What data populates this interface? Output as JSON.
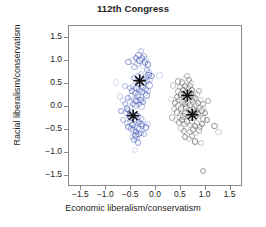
{
  "chart_data": {
    "type": "scatter",
    "title": "112th Congress",
    "xlabel": "Economic liberalism/conservatism",
    "ylabel": "Racial liberalism/conservatism",
    "xlim": [
      -1.75,
      1.75
    ],
    "ylim": [
      -1.75,
      1.75
    ],
    "xticks": [
      -1.5,
      -1.0,
      -0.5,
      0.0,
      0.5,
      1.0,
      1.5
    ],
    "xticklabels": [
      "−1.5",
      "−1.0",
      "−0.5",
      "0.0",
      "0.5",
      "1.0",
      "1.5"
    ],
    "yticks": [
      1.5,
      1.0,
      0.5,
      0.0,
      -0.5,
      -1.0,
      -1.5
    ],
    "yticklabels": [
      "1.5",
      "1.0",
      "0.5",
      "0.0",
      "−0.5",
      "−1.0",
      "−1.5"
    ],
    "grid": false,
    "legend": false,
    "frame": true,
    "series": [
      {
        "name": "democrats",
        "marker": "open-circle",
        "color": "#5b6fc0",
        "points": [
          [
            -0.8,
            0.52
          ],
          [
            -0.62,
            0.44
          ],
          [
            -0.55,
            0.97
          ],
          [
            -0.47,
            1.0
          ],
          [
            -0.43,
            0.86
          ],
          [
            -0.4,
            1.05
          ],
          [
            -0.37,
            0.93
          ],
          [
            -0.35,
            1.12
          ],
          [
            -0.33,
            1.0
          ],
          [
            -0.3,
            1.21
          ],
          [
            -0.28,
            1.04
          ],
          [
            -0.26,
            0.88
          ],
          [
            -0.24,
            1.1
          ],
          [
            -0.22,
            0.96
          ],
          [
            -0.2,
            1.02
          ],
          [
            -0.18,
            0.8
          ],
          [
            -0.16,
            0.91
          ],
          [
            -0.14,
            0.74
          ],
          [
            -0.44,
            0.62
          ],
          [
            -0.4,
            0.58
          ],
          [
            -0.36,
            0.66
          ],
          [
            -0.33,
            0.55
          ],
          [
            -0.3,
            0.7
          ],
          [
            -0.27,
            0.6
          ],
          [
            -0.24,
            0.52
          ],
          [
            -0.21,
            0.64
          ],
          [
            -0.18,
            0.56
          ],
          [
            -0.15,
            0.68
          ],
          [
            -0.12,
            0.58
          ],
          [
            -0.09,
            0.66
          ],
          [
            0.07,
            0.67
          ],
          [
            -0.52,
            0.4
          ],
          [
            -0.48,
            0.34
          ],
          [
            -0.45,
            0.45
          ],
          [
            -0.42,
            0.3
          ],
          [
            -0.39,
            0.4
          ],
          [
            -0.36,
            0.26
          ],
          [
            -0.34,
            0.36
          ],
          [
            -0.31,
            0.22
          ],
          [
            -0.29,
            0.32
          ],
          [
            -0.26,
            0.42
          ],
          [
            -0.23,
            0.28
          ],
          [
            -0.21,
            0.38
          ],
          [
            -0.19,
            0.24
          ],
          [
            -0.17,
            0.34
          ],
          [
            -0.56,
            0.18
          ],
          [
            -0.52,
            0.1
          ],
          [
            -0.49,
            0.22
          ],
          [
            -0.46,
            0.06
          ],
          [
            -0.44,
            0.16
          ],
          [
            -0.41,
            0.02
          ],
          [
            -0.39,
            0.12
          ],
          [
            -0.36,
            0.2
          ],
          [
            -0.34,
            0.05
          ],
          [
            -0.31,
            0.14
          ],
          [
            -0.29,
            0.0
          ],
          [
            -0.26,
            0.1
          ],
          [
            -0.66,
            0.13
          ],
          [
            -0.62,
            0.05
          ],
          [
            -0.58,
            -0.04
          ],
          [
            -0.6,
            -0.14
          ],
          [
            -0.56,
            -0.08
          ],
          [
            -0.54,
            -0.2
          ],
          [
            -0.51,
            -0.12
          ],
          [
            -0.49,
            -0.24
          ],
          [
            -0.46,
            -0.16
          ],
          [
            -0.44,
            -0.28
          ],
          [
            -0.41,
            -0.18
          ],
          [
            -0.39,
            -0.3
          ],
          [
            -0.36,
            -0.22
          ],
          [
            -0.34,
            -0.34
          ],
          [
            -0.31,
            -0.26
          ],
          [
            -0.29,
            -0.38
          ],
          [
            -0.27,
            -0.3
          ],
          [
            -0.58,
            -0.36
          ],
          [
            -0.55,
            -0.44
          ],
          [
            -0.52,
            -0.33
          ],
          [
            -0.5,
            -0.48
          ],
          [
            -0.47,
            -0.4
          ],
          [
            -0.45,
            -0.52
          ],
          [
            -0.42,
            -0.44
          ],
          [
            -0.4,
            -0.56
          ],
          [
            -0.37,
            -0.47
          ],
          [
            -0.35,
            -0.6
          ],
          [
            -0.33,
            -0.5
          ],
          [
            -0.3,
            -0.58
          ],
          [
            -0.28,
            -0.43
          ],
          [
            -0.48,
            -0.66
          ],
          [
            -0.44,
            -0.72
          ],
          [
            -0.41,
            -0.63
          ],
          [
            -0.38,
            -0.7
          ],
          [
            -0.36,
            -0.78
          ],
          [
            -0.42,
            -0.95
          ],
          [
            -0.66,
            -0.3
          ],
          [
            -0.7,
            -0.1
          ],
          [
            -0.72,
            0.22
          ],
          [
            -0.24,
            -0.6
          ],
          [
            -0.2,
            -0.46
          ],
          [
            -0.16,
            -0.38
          ],
          [
            -0.13,
            0.46
          ]
        ]
      },
      {
        "name": "republicans",
        "marker": "open-circle",
        "color": "#6e6e6e",
        "points": [
          [
            0.56,
            0.6
          ],
          [
            0.62,
            0.66
          ],
          [
            0.66,
            0.58
          ],
          [
            0.7,
            0.5
          ],
          [
            0.52,
            0.52
          ],
          [
            0.58,
            0.45
          ],
          [
            0.63,
            0.4
          ],
          [
            0.68,
            0.44
          ],
          [
            0.72,
            0.36
          ],
          [
            0.48,
            0.42
          ],
          [
            0.54,
            0.36
          ],
          [
            0.6,
            0.32
          ],
          [
            0.65,
            0.28
          ],
          [
            0.7,
            0.3
          ],
          [
            0.75,
            0.24
          ],
          [
            0.45,
            0.33
          ],
          [
            0.5,
            0.26
          ],
          [
            0.56,
            0.22
          ],
          [
            0.61,
            0.18
          ],
          [
            0.67,
            0.2
          ],
          [
            0.72,
            0.14
          ],
          [
            0.78,
            0.18
          ],
          [
            0.82,
            0.26
          ],
          [
            0.86,
            0.34
          ],
          [
            0.42,
            0.2
          ],
          [
            0.47,
            0.14
          ],
          [
            0.53,
            0.1
          ],
          [
            0.58,
            0.06
          ],
          [
            0.64,
            0.09
          ],
          [
            0.69,
            0.03
          ],
          [
            0.74,
            0.07
          ],
          [
            0.8,
            0.02
          ],
          [
            0.85,
            0.08
          ],
          [
            0.9,
            0.14
          ],
          [
            0.94,
            0.05
          ],
          [
            0.38,
            0.08
          ],
          [
            0.44,
            0.02
          ],
          [
            0.5,
            -0.04
          ],
          [
            0.55,
            -0.09
          ],
          [
            0.6,
            -0.02
          ],
          [
            0.66,
            -0.07
          ],
          [
            0.71,
            -0.12
          ],
          [
            0.76,
            -0.05
          ],
          [
            0.81,
            -0.1
          ],
          [
            0.87,
            -0.04
          ],
          [
            0.92,
            -0.09
          ],
          [
            0.97,
            -0.03
          ],
          [
            0.36,
            -0.06
          ],
          [
            0.42,
            -0.13
          ],
          [
            0.48,
            -0.18
          ],
          [
            0.54,
            -0.22
          ],
          [
            0.59,
            -0.15
          ],
          [
            0.64,
            -0.2
          ],
          [
            0.69,
            -0.25
          ],
          [
            0.74,
            -0.18
          ],
          [
            0.79,
            -0.23
          ],
          [
            0.84,
            -0.16
          ],
          [
            0.89,
            -0.21
          ],
          [
            0.94,
            -0.26
          ],
          [
            0.98,
            -0.14
          ],
          [
            0.4,
            -0.3
          ],
          [
            0.46,
            -0.35
          ],
          [
            0.52,
            -0.3
          ],
          [
            0.57,
            -0.38
          ],
          [
            0.62,
            -0.33
          ],
          [
            0.68,
            -0.4
          ],
          [
            0.73,
            -0.34
          ],
          [
            0.78,
            -0.42
          ],
          [
            0.83,
            -0.36
          ],
          [
            0.88,
            -0.44
          ],
          [
            0.93,
            -0.38
          ],
          [
            0.5,
            -0.48
          ],
          [
            0.56,
            -0.53
          ],
          [
            0.62,
            -0.47
          ],
          [
            0.68,
            -0.55
          ],
          [
            0.74,
            -0.5
          ],
          [
            0.8,
            -0.58
          ],
          [
            0.86,
            -0.52
          ],
          [
            0.58,
            -0.66
          ],
          [
            0.66,
            -0.7
          ],
          [
            0.72,
            -0.64
          ],
          [
            0.78,
            -0.76
          ],
          [
            0.9,
            -0.8
          ],
          [
            0.95,
            -1.4
          ],
          [
            0.3,
            0.16
          ],
          [
            0.32,
            -0.24
          ],
          [
            1.18,
            -0.42
          ],
          [
            1.26,
            -0.55
          ],
          [
            1.05,
            0.12
          ],
          [
            1.02,
            -0.3
          ],
          [
            0.34,
            0.46
          ],
          [
            0.44,
            0.54
          ]
        ]
      }
    ],
    "medians": [
      {
        "name": "democrat-median-upper",
        "x": -0.33,
        "y": 0.56,
        "marker": "asterisk",
        "color": "#111111"
      },
      {
        "name": "democrat-median-lower",
        "x": -0.46,
        "y": -0.2,
        "marker": "asterisk",
        "color": "#111111"
      },
      {
        "name": "republican-median-upper",
        "x": 0.63,
        "y": 0.24,
        "marker": "asterisk",
        "color": "#111111"
      },
      {
        "name": "republican-median-lower",
        "x": 0.73,
        "y": -0.18,
        "marker": "asterisk",
        "color": "#111111"
      }
    ]
  }
}
